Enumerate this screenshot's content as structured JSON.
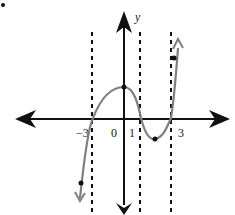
{
  "figure": {
    "bullet": "•",
    "axis_labels": {
      "y": "y"
    },
    "x_tick_labels": [
      {
        "text": "−3",
        "value": -3
      },
      {
        "text": "0",
        "value": 0
      },
      {
        "text": "1",
        "value": 1
      },
      {
        "text": "3",
        "value": 3
      }
    ],
    "dashed_asymptote_guides_x": [
      -2,
      1,
      2
    ],
    "curve": {
      "description": "cubic polynomial with zeros near x=-2, 1, 2",
      "color": "#7f7f7f",
      "marked_points": [
        {
          "label": "left-bottom-point",
          "x": -3,
          "y": "low"
        },
        {
          "label": "y-intercept-local-max",
          "x": 0,
          "y": "positive"
        },
        {
          "label": "local-min",
          "x": 1.5,
          "y": "negative"
        },
        {
          "label": "right-top-point",
          "x": 2.3,
          "y": "high"
        }
      ]
    },
    "colors": {
      "axes": "#111111",
      "curve": "#7f7f7f",
      "dashed_lines": "#111111",
      "points": "#111111"
    }
  }
}
